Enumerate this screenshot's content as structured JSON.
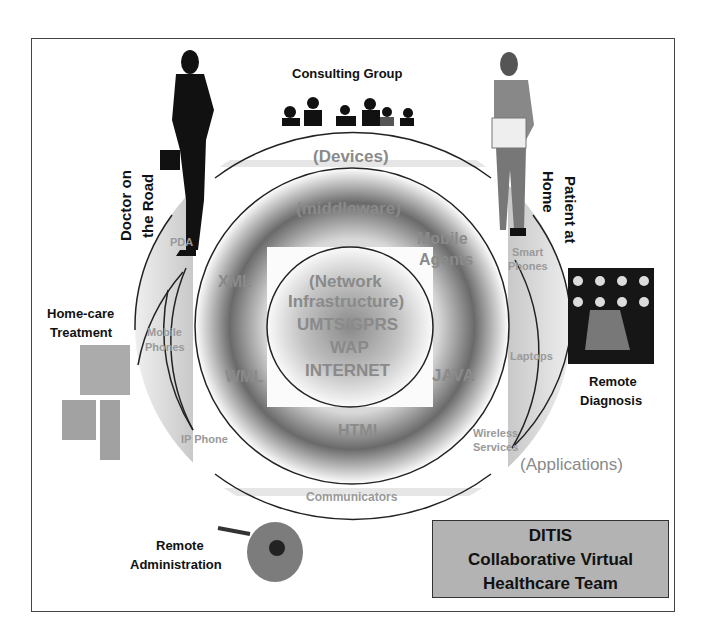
{
  "diagram": {
    "type": "concentric-layers",
    "layers": [
      {
        "name": "outer",
        "label": "(Devices)",
        "items": [
          "PDA",
          "Smart Phones",
          "Mobile Phones",
          "Laptops",
          "IP Phone",
          "Wireless Services",
          "Communicators"
        ]
      },
      {
        "name": "middle",
        "label": "(middleware)",
        "items": [
          "XML",
          "Mobile Agents",
          "WML",
          "JAVA",
          "HTML"
        ]
      },
      {
        "name": "inner",
        "label": "(Network Infrastructure)",
        "items": [
          "UMTS/GPRS",
          "WAP",
          "INTERNET"
        ]
      }
    ],
    "applications_label": "(Applications)",
    "actors": [
      {
        "id": "doctor",
        "label": "Doctor on the Road"
      },
      {
        "id": "consulting",
        "label": "Consulting Group"
      },
      {
        "id": "patient",
        "label": "Patient at Home"
      },
      {
        "id": "homecare",
        "label": "Home-care Treatment"
      },
      {
        "id": "diagnosis",
        "label": "Remote Diagnosis"
      },
      {
        "id": "admin",
        "label": "Remote Administration"
      }
    ],
    "title_box": {
      "line1": "DITIS",
      "line2": "Collaborative Virtual",
      "line3": "Healthcare Team"
    }
  },
  "labels": {
    "devices": "(Devices)",
    "middleware": "(middleware)",
    "network1": "(Network",
    "network2": "Infrastructure)",
    "umts": "UMTS/GPRS",
    "wap": "WAP",
    "internet": "INTERNET",
    "xml": "XML",
    "mobile_agents1": "Mobile",
    "mobile_agents2": "Agents",
    "wml": "WML",
    "java": "JAVA",
    "html": "HTML",
    "pda": "PDA",
    "smart1": "Smart",
    "smart2": "Phones",
    "mobile1": "Mobile",
    "mobile2": "Phones",
    "laptops": "Laptops",
    "ipphone": "IP Phone",
    "wireless1": "Wireless",
    "wireless2": "Services",
    "communicators": "Communicators",
    "applications": "(Applications)",
    "consulting": "Consulting Group",
    "doctor1": "Doctor on",
    "doctor2": "the Road",
    "patient1": "Patient at",
    "patient2": "Home",
    "homecare1": "Home-care",
    "homecare2": "Treatment",
    "diagnosis1": "Remote",
    "diagnosis2": "Diagnosis",
    "admin1": "Remote",
    "admin2": "Administration"
  }
}
